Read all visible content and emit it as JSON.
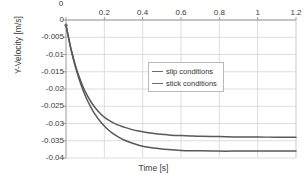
{
  "chart_data": {
    "type": "line",
    "title": "",
    "xlabel": "Time [s]",
    "ylabel": "Y-Velocity [m/s]",
    "xlim": [
      0,
      1.2
    ],
    "ylim": [
      -0.04,
      0
    ],
    "grid": true,
    "x_axis_position": "top",
    "legend_position": "center",
    "xticks": [
      "0.2",
      "0.4",
      "0.6",
      "0.8",
      "1",
      "1.2"
    ],
    "xtick_values": [
      0.2,
      0.4,
      0.6,
      0.8,
      1,
      1.2
    ],
    "yticks": [
      "0",
      "-0.005",
      "-0.01",
      "-0.015",
      "-0.02",
      "-0.025",
      "-0.03",
      "-0.035",
      "-0.04"
    ],
    "ytick_values": [
      0,
      -0.005,
      -0.01,
      -0.015,
      -0.02,
      -0.025,
      -0.03,
      -0.035,
      -0.04
    ],
    "series": [
      {
        "name": "slip conditions",
        "color": "#585858",
        "x": [
          0,
          0.01,
          0.02,
          0.03,
          0.05,
          0.07,
          0.09,
          0.11,
          0.13,
          0.15,
          0.18,
          0.21,
          0.24,
          0.27,
          0.3,
          0.34,
          0.38,
          0.42,
          0.46,
          0.5,
          0.55,
          0.6,
          0.65,
          0.7,
          0.8,
          0.9,
          1.0,
          1.1,
          1.2
        ],
        "values": [
          -0.0015,
          -0.0042,
          -0.0068,
          -0.0092,
          -0.0133,
          -0.0167,
          -0.0195,
          -0.0218,
          -0.0237,
          -0.0253,
          -0.0272,
          -0.0286,
          -0.0296,
          -0.0304,
          -0.031,
          -0.0317,
          -0.0322,
          -0.0326,
          -0.0329,
          -0.0331,
          -0.0334,
          -0.0335,
          -0.0336,
          -0.0337,
          -0.0338,
          -0.0339,
          -0.0339,
          -0.034,
          -0.034
        ]
      },
      {
        "name": "stick conditions",
        "color": "#585858",
        "x": [
          0,
          0.01,
          0.02,
          0.03,
          0.05,
          0.07,
          0.09,
          0.11,
          0.13,
          0.15,
          0.18,
          0.21,
          0.24,
          0.27,
          0.3,
          0.34,
          0.38,
          0.42,
          0.46,
          0.5,
          0.55,
          0.6,
          0.65,
          0.7,
          0.8,
          0.9,
          1.0,
          1.1,
          1.2
        ],
        "values": [
          -0.0015,
          -0.0043,
          -0.007,
          -0.0095,
          -0.0138,
          -0.0174,
          -0.0205,
          -0.0231,
          -0.0253,
          -0.0272,
          -0.0295,
          -0.0313,
          -0.0327,
          -0.0338,
          -0.0347,
          -0.0356,
          -0.0363,
          -0.0368,
          -0.0371,
          -0.0374,
          -0.0376,
          -0.0378,
          -0.0379,
          -0.0379,
          -0.038,
          -0.038,
          -0.038,
          -0.038,
          -0.038
        ]
      }
    ]
  },
  "legend": {
    "items": [
      {
        "label": "slip conditions"
      },
      {
        "label": "stick conditions"
      }
    ]
  },
  "axes": {
    "x_title": "Time [s]",
    "y_title": "Y-Velocity [m/s]"
  },
  "colors": {
    "curve": "#585858",
    "grid": "#d4d4d4",
    "axis": "#9a9a9a",
    "text": "#333333",
    "background": "#ffffff"
  }
}
